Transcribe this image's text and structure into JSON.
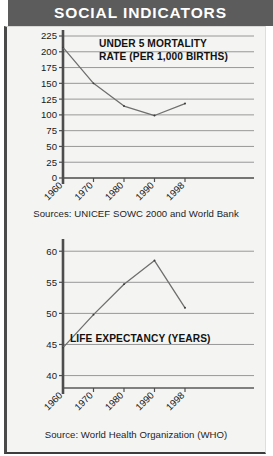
{
  "header": {
    "title": "SOCIAL INDICATORS"
  },
  "colors": {
    "title_band_bg": "#5c5c5c",
    "title_text": "#ffffff",
    "panel_bg": "#f4f4f2",
    "gridline": "#8d8d8d",
    "axis": "#4d4d4d",
    "dataline": "#6f6f6f"
  },
  "charts": [
    {
      "id": "under-5-mortality",
      "title": "UNDER 5 MORTALITY\nRATE (PER 1,000 BIRTHS)",
      "title_line1": "UNDER 5 MORTALITY",
      "title_line2": "RATE (PER 1,000 BIRTHS)",
      "source": "Sources: UNICEF SOWC 2000 and World Bank"
    },
    {
      "id": "life-expectancy",
      "title": "LIFE EXPECTANCY (YEARS)",
      "title_line1": "LIFE EXPECTANCY (YEARS)",
      "source": "Source: World Health Organization (WHO)"
    }
  ],
  "chart_data": [
    {
      "type": "line",
      "title": "UNDER 5 MORTALITY RATE (PER 1,000 BIRTHS)",
      "xlabel": "",
      "ylabel": "",
      "categories": [
        "1960",
        "1970",
        "1980",
        "1990",
        "1998"
      ],
      "x": [
        1960,
        1970,
        1980,
        1990,
        1998
      ],
      "values": [
        207,
        150,
        114,
        99,
        118
      ],
      "series": [
        {
          "name": "Under 5 mortality rate (per 1,000 births)",
          "values": [
            207,
            150,
            114,
            99,
            118
          ]
        }
      ],
      "ylim": [
        0,
        225
      ],
      "yticks": [
        0,
        25,
        50,
        75,
        100,
        125,
        150,
        175,
        200,
        225
      ],
      "ytick_labels": [
        "0",
        "25",
        "50",
        "75",
        "100",
        "125",
        "150",
        "175",
        "200",
        "225"
      ],
      "xtick_labels": [
        "1960",
        "1970",
        "1980",
        "1990",
        "1998"
      ],
      "grid": true,
      "legend": "none",
      "source": "Sources: UNICEF SOWC 2000 and World Bank"
    },
    {
      "type": "line",
      "title": "LIFE EXPECTANCY (YEARS)",
      "xlabel": "",
      "ylabel": "",
      "categories": [
        "1960",
        "1970",
        "1980",
        "1990",
        "1998"
      ],
      "x": [
        1960,
        1970,
        1980,
        1990,
        1998
      ],
      "values": [
        44.5,
        49.8,
        54.7,
        58.5,
        50.9
      ],
      "series": [
        {
          "name": "Life expectancy (years)",
          "values": [
            44.5,
            49.8,
            54.7,
            58.5,
            50.9
          ]
        }
      ],
      "ylim": [
        38,
        61
      ],
      "yticks": [
        40,
        45,
        50,
        55,
        60
      ],
      "ytick_labels": [
        "40",
        "45",
        "50",
        "55",
        "60"
      ],
      "xtick_labels": [
        "1960",
        "1970",
        "1980",
        "1990",
        "1998"
      ],
      "grid": true,
      "legend": "none",
      "source": "Source: World Health Organization (WHO)"
    }
  ]
}
